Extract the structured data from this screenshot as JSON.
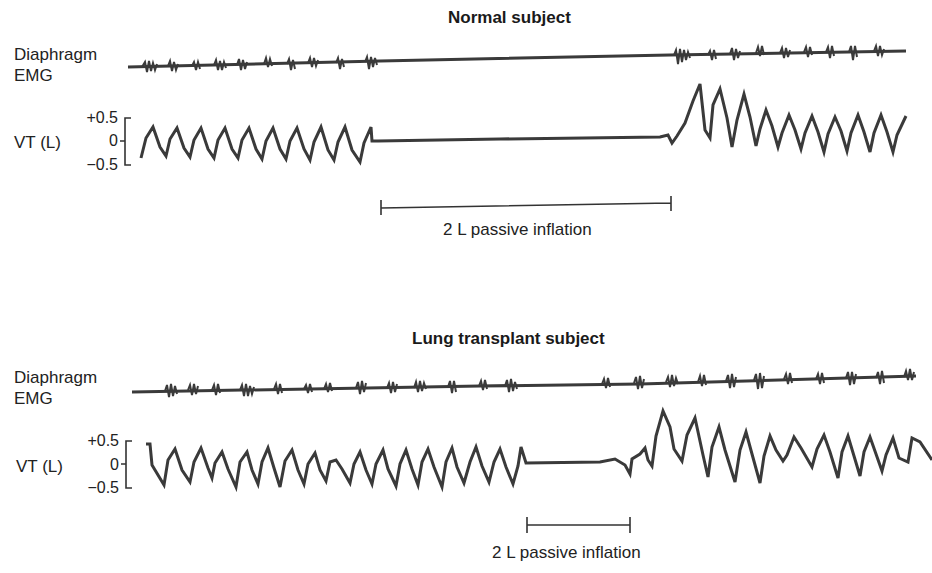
{
  "panels": [
    {
      "title": "Normal subject",
      "emg_label_line1": "Diaphragm",
      "emg_label_line2": "EMG",
      "vt_label": "VT (L)",
      "ticks": [
        "+0.5",
        "0",
        "−0.5"
      ],
      "inflation_label": "2 L passive inflation"
    },
    {
      "title": "Lung transplant subject",
      "emg_label_line1": "Diaphragm",
      "emg_label_line2": "EMG",
      "vt_label": "VT (L)",
      "ticks": [
        "+0.5",
        "0",
        "−0.5"
      ],
      "inflation_label": "2 L passive inflation"
    }
  ],
  "colors": {
    "trace": "#3a3a3a",
    "text": "#222222",
    "background": "#ffffff"
  }
}
